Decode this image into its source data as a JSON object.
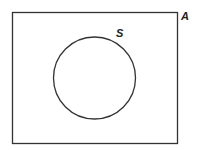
{
  "diagram": {
    "type": "venn",
    "universal_set": {
      "label": "A"
    },
    "subset": {
      "label": "S"
    },
    "colors": {
      "stroke": "#333333",
      "background": "#ffffff"
    }
  }
}
